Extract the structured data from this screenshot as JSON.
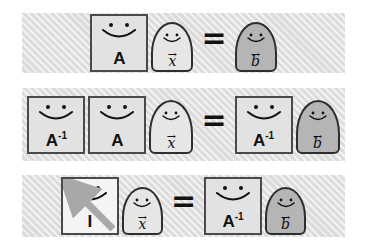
{
  "figure": {
    "background_color": "#ffffff",
    "band_color": "#dcdcdc",
    "matrix_fill": "#e2e2e2",
    "matrix_border": "#4a4a4a",
    "vector_fill_light": "#e6e6e6",
    "vector_fill_dark": "#b5b5b5",
    "vector_border": "#2e2e2e",
    "arrow_color": "#a8a8a8"
  },
  "symbols": {
    "equals": "=",
    "vector_accent": "→",
    "A": "A",
    "A_inv": "A",
    "A_inv_sup": "-1",
    "I": "I",
    "x": "x",
    "b": "b"
  },
  "rows": [
    {
      "id": "row-1",
      "equation": "A x = b",
      "left": [
        {
          "kind": "matrix",
          "label": "A",
          "sup": ""
        },
        {
          "kind": "vector",
          "label": "x",
          "shade": "light"
        }
      ],
      "right": [
        {
          "kind": "vector",
          "label": "b",
          "shade": "dark"
        }
      ]
    },
    {
      "id": "row-2",
      "equation": "A^-1 A x = A^-1 b",
      "left": [
        {
          "kind": "matrix",
          "label": "A",
          "sup": "-1"
        },
        {
          "kind": "matrix",
          "label": "A",
          "sup": ""
        },
        {
          "kind": "vector",
          "label": "x",
          "shade": "light"
        }
      ],
      "right": [
        {
          "kind": "matrix",
          "label": "A",
          "sup": "-1"
        },
        {
          "kind": "vector",
          "label": "b",
          "shade": "dark"
        }
      ]
    },
    {
      "id": "row-3",
      "equation": "I x = A^-1 b",
      "left": [
        {
          "kind": "matrix-identity",
          "label": "I",
          "sup": ""
        },
        {
          "kind": "vector",
          "label": "x",
          "shade": "light"
        }
      ],
      "right": [
        {
          "kind": "matrix",
          "label": "A",
          "sup": "-1"
        },
        {
          "kind": "vector",
          "label": "b",
          "shade": "dark"
        }
      ]
    }
  ]
}
